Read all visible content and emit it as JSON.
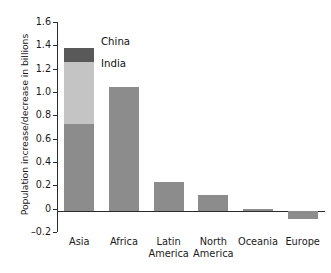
{
  "chart_data": {
    "type": "bar",
    "title": "",
    "subtitle": "",
    "xlabel": "",
    "ylabel": "Population increase/decrease in billions",
    "categories": [
      "Asia",
      "Africa",
      "Latin America",
      "North America",
      "Oceania",
      "Europe"
    ],
    "category_lines": [
      [
        "Asia"
      ],
      [
        "Africa"
      ],
      [
        "Latin",
        "America"
      ],
      [
        "North",
        "America"
      ],
      [
        "Oceania"
      ],
      [
        "Europe"
      ]
    ],
    "values": [
      1.4,
      1.065,
      0.25,
      0.14,
      0.015,
      -0.065
    ],
    "stacked": true,
    "stack_note": "Only the Asia bar is subdivided; its segments from bottom to top are rest-of-Asia, India, China.",
    "series": [
      {
        "name": "Rest of Asia",
        "values": [
          0.745,
          1.065,
          0.25,
          0.14,
          0.015,
          -0.065
        ],
        "color": "#8c8c8c"
      },
      {
        "name": "India",
        "values": [
          0.535,
          0,
          0,
          0,
          0,
          0
        ],
        "color": "#c4c4c4"
      },
      {
        "name": "China",
        "values": [
          0.12,
          0,
          0,
          0,
          0,
          0
        ],
        "color": "#595959"
      }
    ],
    "asia_segments": [
      {
        "label": "Rest of Asia",
        "from": 0.0,
        "to": 0.745,
        "color": "#8c8c8c"
      },
      {
        "label": "India",
        "from": 0.745,
        "to": 1.28,
        "color": "#c4c4c4"
      },
      {
        "label": "China",
        "from": 1.28,
        "to": 1.4,
        "color": "#595959"
      }
    ],
    "annotations": [
      {
        "text": "China",
        "points_to": "Asia bar top segment"
      },
      {
        "text": "India",
        "points_to": "Asia bar middle segment"
      }
    ],
    "yticks": [
      1.6,
      1.4,
      1.2,
      1.0,
      0.8,
      0.6,
      0.4,
      0.2,
      0,
      -0.2
    ],
    "ytick_labels": [
      "1.6",
      "1.4",
      "1.2",
      "1.0",
      "0.8",
      "0.6",
      "0.4",
      "0.2",
      "0",
      "–0.2"
    ],
    "ylim": [
      -0.2,
      1.6
    ],
    "grid": false,
    "legend": "inline-annotations",
    "legend_position": "inside-upper-left",
    "bar_color": "#8c8c8c",
    "axis_color": "#2b2b2b",
    "background": "#ffffff"
  }
}
